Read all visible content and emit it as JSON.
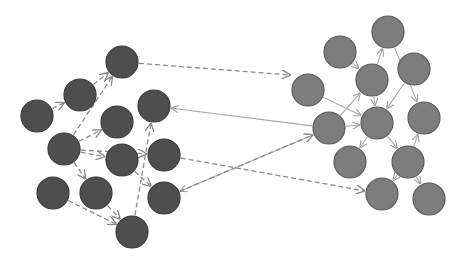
{
  "diagram": {
    "colors": {
      "left_node": "#4e4e4e",
      "left_stroke": "#3a3a3a",
      "right_node": "#7d7d7d",
      "right_stroke": "#5a5a5a",
      "dashed_edge": "#8a8a8a",
      "solid_edge": "#a8a8a8"
    },
    "node_radius": 16,
    "left_nodes": [
      {
        "id": "A",
        "x": 122,
        "y": 62
      },
      {
        "id": "B",
        "x": 80,
        "y": 95
      },
      {
        "id": "C",
        "x": 37,
        "y": 116
      },
      {
        "id": "D",
        "x": 154,
        "y": 106
      },
      {
        "id": "E",
        "x": 117,
        "y": 122
      },
      {
        "id": "F",
        "x": 64,
        "y": 149
      },
      {
        "id": "G",
        "x": 122,
        "y": 160
      },
      {
        "id": "H",
        "x": 164,
        "y": 155
      },
      {
        "id": "I",
        "x": 53,
        "y": 193
      },
      {
        "id": "J",
        "x": 96,
        "y": 193
      },
      {
        "id": "K",
        "x": 164,
        "y": 198
      },
      {
        "id": "L",
        "x": 132,
        "y": 232
      }
    ],
    "right_nodes": [
      {
        "id": "R1",
        "x": 388,
        "y": 32
      },
      {
        "id": "R2",
        "x": 340,
        "y": 52
      },
      {
        "id": "R3",
        "x": 372,
        "y": 80
      },
      {
        "id": "R4",
        "x": 414,
        "y": 69
      },
      {
        "id": "R5",
        "x": 308,
        "y": 90
      },
      {
        "id": "R6",
        "x": 329,
        "y": 128
      },
      {
        "id": "R7",
        "x": 377,
        "y": 123
      },
      {
        "id": "R8",
        "x": 424,
        "y": 118
      },
      {
        "id": "R9",
        "x": 350,
        "y": 162
      },
      {
        "id": "R10",
        "x": 408,
        "y": 162
      },
      {
        "id": "R11",
        "x": 382,
        "y": 194
      },
      {
        "id": "R12",
        "x": 429,
        "y": 199
      }
    ],
    "dashed_edges": [
      [
        "C",
        "B"
      ],
      [
        "F",
        "A"
      ],
      [
        "B",
        "A"
      ],
      [
        "F",
        "E"
      ],
      [
        "F",
        "G"
      ],
      [
        "F",
        "H"
      ],
      [
        "F",
        "J"
      ],
      [
        "J",
        "L"
      ],
      [
        "I",
        "L"
      ],
      [
        "L",
        "D"
      ],
      [
        "G",
        "K"
      ],
      [
        "A",
        "R5x"
      ],
      [
        "H",
        "R11"
      ],
      [
        "K",
        "R6"
      ]
    ],
    "solid_edges": [
      [
        "R6",
        "D"
      ],
      [
        "R6",
        "K"
      ],
      [
        "R5",
        "R7"
      ],
      [
        "R2",
        "R3"
      ],
      [
        "R3",
        "R7"
      ],
      [
        "R3",
        "R1"
      ],
      [
        "R1",
        "R8"
      ],
      [
        "R4",
        "R7"
      ],
      [
        "R6",
        "R3"
      ],
      [
        "R7",
        "R9"
      ],
      [
        "R7",
        "R10"
      ],
      [
        "R10",
        "R8"
      ],
      [
        "R10",
        "R11"
      ],
      [
        "R10",
        "R12"
      ],
      [
        "R6",
        "R7"
      ]
    ]
  }
}
